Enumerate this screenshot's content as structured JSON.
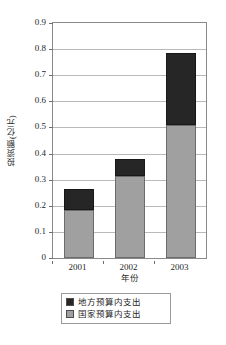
{
  "chart_data": {
    "type": "bar",
    "title": "",
    "subtitle": "",
    "stacked": true,
    "orientation": "vertical",
    "categories": [
      "2001",
      "2002",
      "2003"
    ],
    "series": [
      {
        "name": "国家预算内支出",
        "color": "#a0a0a0",
        "values": [
          0.185,
          0.315,
          0.51
        ]
      },
      {
        "name": "地方预算内支出",
        "color": "#262626",
        "values": [
          0.08,
          0.065,
          0.275
        ]
      }
    ],
    "totals": [
      0.265,
      0.38,
      0.785
    ],
    "xlabel": "年份",
    "ylabel": "投资额(亿元)",
    "ylim": [
      0,
      0.9
    ],
    "ytick_step": 0.1,
    "yticks": [
      "0.9",
      "0.8",
      "0.7",
      "0.6",
      "0.5",
      "0.4",
      "0.3",
      "0.2",
      "0.1",
      "0"
    ],
    "ytick_values": [
      0.9,
      0.8,
      0.7,
      0.6,
      0.5,
      0.4,
      0.3,
      0.2,
      0.1,
      0
    ],
    "grid": "horizontal",
    "legend_position": "bottom",
    "legend": [
      {
        "label": "地方预算内支出",
        "color": "#262626"
      },
      {
        "label": "国家预算内支出",
        "color": "#a0a0a0"
      }
    ]
  }
}
